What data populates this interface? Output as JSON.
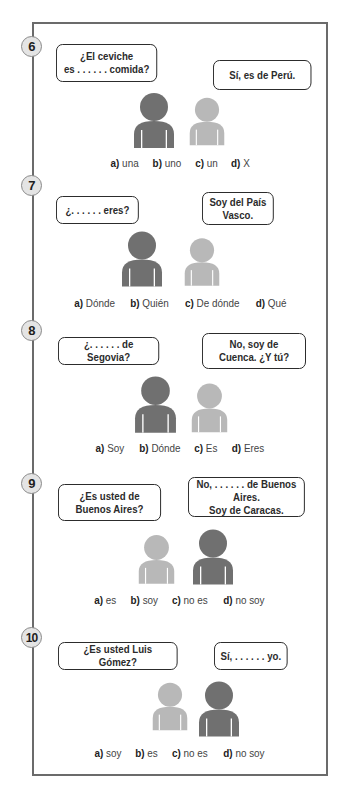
{
  "colors": {
    "frame_border": "#6b6b6b",
    "badge_fill": "#e4e4e4",
    "person_dark": "#707070",
    "person_light": "#b8b8b8",
    "bubble_border": "#222222"
  },
  "questions": [
    {
      "number": "6",
      "bubbles": [
        {
          "text": "¿El ceviche\nes . . . . . . comida?",
          "speaker": "dark"
        },
        {
          "text": "Sí, es de Perú.",
          "speaker": "light"
        }
      ],
      "people": [
        {
          "shade": "dark",
          "icon": "person-icon"
        },
        {
          "shade": "light",
          "icon": "person-icon"
        }
      ],
      "options": [
        {
          "letter": "a)",
          "word": "una"
        },
        {
          "letter": "b)",
          "word": "uno"
        },
        {
          "letter": "c)",
          "word": "un"
        },
        {
          "letter": "d)",
          "word": "X"
        }
      ]
    },
    {
      "number": "7",
      "bubbles": [
        {
          "text": "¿. . . . . . eres?",
          "speaker": "dark"
        },
        {
          "text": "Soy del País\nVasco.",
          "speaker": "light"
        }
      ],
      "people": [
        {
          "shade": "dark",
          "icon": "person-icon"
        },
        {
          "shade": "light",
          "icon": "person-icon"
        }
      ],
      "options": [
        {
          "letter": "a)",
          "word": "Dónde"
        },
        {
          "letter": "b)",
          "word": "Quién"
        },
        {
          "letter": "c)",
          "word": "De dónde"
        },
        {
          "letter": "d)",
          "word": "Qué"
        }
      ]
    },
    {
      "number": "8",
      "bubbles": [
        {
          "text": "¿. . . . . . de Segovia?",
          "speaker": "dark"
        },
        {
          "text": "No, soy de\nCuenca. ¿Y tú?",
          "speaker": "light"
        }
      ],
      "people": [
        {
          "shade": "dark",
          "icon": "person-icon"
        },
        {
          "shade": "light",
          "icon": "person-icon"
        }
      ],
      "options": [
        {
          "letter": "a)",
          "word": "Soy"
        },
        {
          "letter": "b)",
          "word": "Dónde"
        },
        {
          "letter": "c)",
          "word": "Es"
        },
        {
          "letter": "d)",
          "word": "Eres"
        }
      ]
    },
    {
      "number": "9",
      "bubbles": [
        {
          "text": "¿Es usted de\nBuenos Aires?",
          "speaker": "light"
        },
        {
          "text": "No, . . . . . . de Buenos Aires.\nSoy de Caracas.",
          "speaker": "dark"
        }
      ],
      "people": [
        {
          "shade": "light",
          "icon": "person-icon"
        },
        {
          "shade": "dark",
          "icon": "person-icon"
        }
      ],
      "options": [
        {
          "letter": "a)",
          "word": "es"
        },
        {
          "letter": "b)",
          "word": "soy"
        },
        {
          "letter": "c)",
          "word": "no es"
        },
        {
          "letter": "d)",
          "word": "no soy"
        }
      ]
    },
    {
      "number": "10",
      "bubbles": [
        {
          "text": "¿Es usted Luis Gómez?",
          "speaker": "light"
        },
        {
          "text": "Sí, . . . . . . yo.",
          "speaker": "dark"
        }
      ],
      "people": [
        {
          "shade": "light",
          "icon": "person-icon"
        },
        {
          "shade": "dark",
          "icon": "person-icon"
        }
      ],
      "options": [
        {
          "letter": "a)",
          "word": "soy"
        },
        {
          "letter": "b)",
          "word": "es"
        },
        {
          "letter": "c)",
          "word": "no es"
        },
        {
          "letter": "d)",
          "word": "no soy"
        }
      ]
    }
  ]
}
